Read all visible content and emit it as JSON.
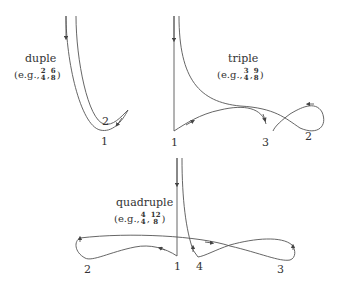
{
  "patterns": [
    {
      "name": "duple",
      "example_prefix": "(e.g.,",
      "example_suffix": ")",
      "signatures": [
        {
          "top": "2",
          "bottom": "4"
        },
        {
          "top": "6",
          "bottom": "8"
        }
      ],
      "beats": [
        "1",
        "2"
      ]
    },
    {
      "name": "triple",
      "example_prefix": "(e.g.,",
      "example_suffix": ")",
      "signatures": [
        {
          "top": "3",
          "bottom": "4"
        },
        {
          "top": "9",
          "bottom": "8"
        }
      ],
      "beats": [
        "1",
        "2",
        "3"
      ]
    },
    {
      "name": "quadruple",
      "example_prefix": "(e.g.,",
      "example_suffix": ")",
      "signatures": [
        {
          "top": "4",
          "bottom": "4"
        },
        {
          "top": "12",
          "bottom": "8"
        }
      ],
      "beats": [
        "1",
        "2",
        "3",
        "4"
      ]
    }
  ],
  "colors": {
    "line": "#444444",
    "text": "#333333",
    "background": "#ffffff"
  }
}
